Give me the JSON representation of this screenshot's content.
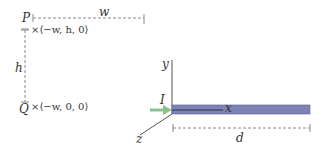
{
  "diagram": {
    "points": {
      "P": {
        "label": "P",
        "coords": "×⟨−w, h, 0⟩"
      },
      "Q": {
        "label": "Q",
        "coords": "×⟨−w, 0, 0⟩"
      }
    },
    "dimensions": {
      "width_label": "w",
      "height_label": "h",
      "length_label": "d"
    },
    "axes": {
      "x": "x",
      "y": "y",
      "z": "z"
    },
    "current_label": "I",
    "colors": {
      "bar_fill": "#7d84b5",
      "bar_stroke": "#3a3f6e",
      "arrow": "#8cc08c",
      "dashed": "#888888",
      "axis": "#555555",
      "text": "#333333"
    }
  }
}
